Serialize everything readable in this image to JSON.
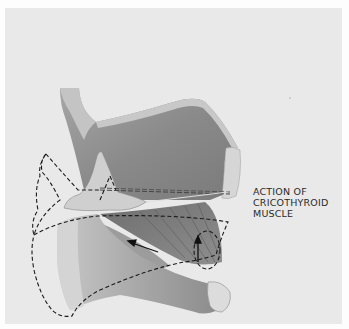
{
  "figure": {
    "caption_lines": [
      "ACTION  OF",
      "CRICOTHYROID",
      "MUSCLE"
    ],
    "colors": {
      "background": "#fdfdfd",
      "panel": "#e9e9e9",
      "cartilage_dark": "#8e8e8e",
      "cartilage_mid": "#b4b4b4",
      "cartilage_light": "#d8d8d8",
      "dashed_outline": "#1a1a1a"
    }
  }
}
